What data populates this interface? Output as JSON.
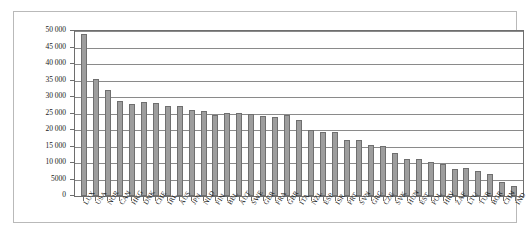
{
  "chart_data": {
    "type": "bar",
    "title": "",
    "subtitle": "",
    "xlabel": "",
    "ylabel": "",
    "ylim": [
      0,
      50000
    ],
    "grid": true,
    "legend": false,
    "legend_position": "none",
    "bar_color": "#9d9d9d",
    "bar_border_color": "#6f6f6f",
    "gridline_color": "#8a8a8a",
    "axis_color": "#6e6e6e",
    "ytick_labels": [
      "50 000",
      "45 000",
      "40 000",
      "35 000",
      "30 000",
      "25 000",
      "20 000",
      "15 000",
      "10 000",
      "5000",
      "0"
    ],
    "ytick_values": [
      50000,
      45000,
      40000,
      35000,
      30000,
      25000,
      20000,
      15000,
      10000,
      5000,
      0
    ],
    "categories": [
      "LUX",
      "USA",
      "NOR",
      "CAN",
      "HKG",
      "DNK",
      "CHE",
      "IRL",
      "AUS",
      "JPN",
      "NLD",
      "FIN",
      "BEL",
      "AUT",
      "SWE",
      "GER",
      "FRA",
      "GBR",
      "ITA",
      "NZL",
      "ESP",
      "ISR",
      "PRT",
      "SVN",
      "GRC",
      "CZE",
      "SVK",
      "HUN",
      "EST",
      "POL",
      "HRV",
      "ZAF",
      "LTU",
      "TUR",
      "BGR",
      "CHN",
      "IND"
    ],
    "values": [
      49000,
      35600,
      32100,
      28700,
      27900,
      28500,
      28300,
      27300,
      27300,
      26100,
      25800,
      24600,
      25100,
      25100,
      24800,
      24100,
      23800,
      24400,
      23000,
      20000,
      19300,
      19300,
      17100,
      17000,
      15600,
      15100,
      12900,
      11300,
      11200,
      10200,
      9800,
      8200,
      8600,
      7600,
      6700,
      4200,
      2900
    ]
  }
}
